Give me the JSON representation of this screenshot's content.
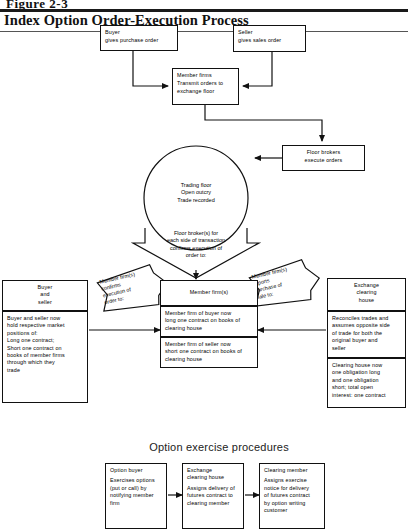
{
  "figure": {
    "number": "Figure 2-3",
    "title": "Index Option Order-Execution Process"
  },
  "top_row": {
    "buyer": {
      "heading": "Buyer",
      "body": "gives purchase order"
    },
    "seller": {
      "heading": "Seller",
      "body": "gives sales order"
    }
  },
  "member_firms": {
    "heading": "Member firms",
    "body": "Transmit orders to\nexchange floor"
  },
  "floor_brokers": {
    "heading": "Floor brokers",
    "body": "execute orders"
  },
  "trading_circle": {
    "lines": "Trading floor\nOpen outcry\nTrade recorded"
  },
  "funnel": {
    "text": "Floor broker(s) for\neach side of transaction\nconfirms execution of\norder to:"
  },
  "banners": {
    "left": "Member firm(s)\nconfirms\nexecution of\norder  to:",
    "right": "Member firm(s)\nreports\npurchase of\nsale  to:"
  },
  "columns": [
    {
      "id": "buyer-and-seller",
      "header": "Buyer\nand\nseller",
      "cells": [
        "Buyer and seller now\nhold respective market\npositions of:\nLong one contract;\nShort one contract on\nbooks of member firms\nthrough which they\ntrade"
      ]
    },
    {
      "id": "member-firms",
      "header": "Member firm(s)",
      "cells": [
        "Member firm of buyer now\nlong one contract on books of\nclearing house",
        "Member firm of seller now\nshort one contract on books of\nclearing house"
      ]
    },
    {
      "id": "exchange-clearing-house",
      "header": "Exchange\nclearing\nhouse",
      "cells": [
        "Reconciles trades and\nassumes opposite side\nof trade for both the\noriginal buyer and\nseller",
        "Clearing house now\none obligation long\nand one obligation\nshort; total open\ninterest:  one contract"
      ]
    }
  ],
  "bottom": {
    "section_title": "Option exercise procedures",
    "steps": [
      {
        "heading": "Option  buyer",
        "body": "Exercises options\n(put or call) by\nnotifying member\nfirm"
      },
      {
        "heading": "Exchange\nclearing house",
        "body": "Assigns delivery of\nfutures contract to\nclearing member"
      },
      {
        "heading": "Clearing member",
        "body": "Assigns exercise\nnotice for delivery\nof futures contract\nby option writing\ncustomer"
      }
    ]
  },
  "colors": {
    "ink": "#111111",
    "paper": "#ffffff"
  }
}
